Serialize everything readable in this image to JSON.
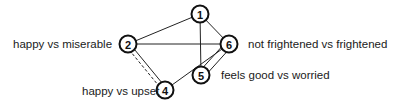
{
  "diagram": {
    "type": "network graph",
    "colors": {
      "line": "#222222",
      "node_fill": "#ffffff",
      "text": "#1a1a1a"
    },
    "nodes": [
      {
        "id": "1",
        "label": "1",
        "x": 200,
        "y": 14,
        "description": ""
      },
      {
        "id": "2",
        "label": "2",
        "x": 128,
        "y": 44,
        "description": "happy vs miserable"
      },
      {
        "id": "6",
        "label": "6",
        "x": 229,
        "y": 44,
        "description": "not frightened vs frightened"
      },
      {
        "id": "5",
        "label": "5",
        "x": 201,
        "y": 75,
        "description": "feels good vs worried"
      },
      {
        "id": "4",
        "label": "4",
        "x": 165,
        "y": 90,
        "description": "happy vs upset"
      }
    ],
    "edges": [
      {
        "from": "1",
        "to": "2",
        "style": "solid"
      },
      {
        "from": "1",
        "to": "6",
        "style": "solid"
      },
      {
        "from": "1",
        "to": "5",
        "style": "solid"
      },
      {
        "from": "2",
        "to": "6",
        "style": "solid"
      },
      {
        "from": "2",
        "to": "4",
        "style": "solid+dashed double"
      },
      {
        "from": "4",
        "to": "6",
        "style": "solid"
      },
      {
        "from": "5",
        "to": "6",
        "style": "double"
      }
    ],
    "labels": {
      "node2": "happy vs miserable",
      "node6": "not frightened vs frightened",
      "node5": "feels good vs worried",
      "node4": "happy vs upset"
    }
  }
}
